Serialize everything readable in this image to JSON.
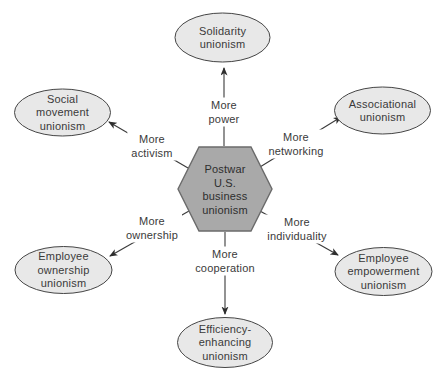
{
  "diagram": {
    "center_node": {
      "id": "postwar-us-business-unionism",
      "shape": "hexagon",
      "label": [
        "Postwar",
        "U.S.",
        "business",
        "unionism"
      ]
    },
    "nodes": [
      {
        "id": "solidarity-unionism",
        "position": "top",
        "shape": "ellipse",
        "label": [
          "Solidarity",
          "unionism"
        ]
      },
      {
        "id": "social-movement-unionism",
        "position": "upper-left",
        "shape": "ellipse",
        "label": [
          "Social",
          "movement",
          "unionism"
        ]
      },
      {
        "id": "associational-unionism",
        "position": "upper-right",
        "shape": "ellipse",
        "label": [
          "Associational",
          "unionism"
        ]
      },
      {
        "id": "employee-ownership-unionism",
        "position": "lower-left",
        "shape": "ellipse",
        "label": [
          "Employee",
          "ownership",
          "unionism"
        ]
      },
      {
        "id": "employee-empowerment-unionism",
        "position": "lower-right",
        "shape": "ellipse",
        "label": [
          "Employee",
          "empowerment",
          "unionism"
        ]
      },
      {
        "id": "efficiency-enhancing-unionism",
        "position": "bottom",
        "shape": "ellipse",
        "label": [
          "Efficiency-",
          "enhancing",
          "unionism"
        ]
      }
    ],
    "edges": [
      {
        "from": "postwar-us-business-unionism",
        "to": "solidarity-unionism",
        "label": [
          "More",
          "power"
        ]
      },
      {
        "from": "postwar-us-business-unionism",
        "to": "social-movement-unionism",
        "label": [
          "More",
          "activism"
        ]
      },
      {
        "from": "postwar-us-business-unionism",
        "to": "associational-unionism",
        "label": [
          "More",
          "networking"
        ]
      },
      {
        "from": "postwar-us-business-unionism",
        "to": "employee-ownership-unionism",
        "label": [
          "More",
          "ownership"
        ]
      },
      {
        "from": "postwar-us-business-unionism",
        "to": "employee-empowerment-unionism",
        "label": [
          "More",
          "individuality"
        ]
      },
      {
        "from": "postwar-us-business-unionism",
        "to": "efficiency-enhancing-unionism",
        "label": [
          "More",
          "cooperation"
        ]
      }
    ],
    "colors": {
      "background": "#ffffff",
      "hexagon_fill": "#a9a9a9",
      "hexagon_stroke": "#6b6b6b",
      "ellipse_fill": "#e8e8e8",
      "ellipse_stroke": "#454545",
      "connector": "#3a3a3a",
      "text": "#3a3a3a"
    }
  }
}
